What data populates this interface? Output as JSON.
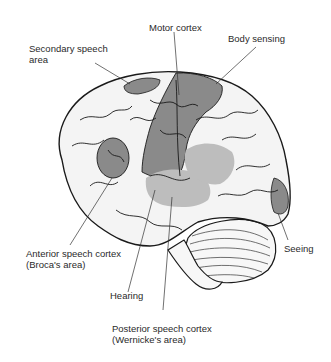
{
  "diagram": {
    "labels": {
      "secondary_speech": [
        "Secondary speech",
        "area"
      ],
      "motor_cortex": [
        "Motor cortex"
      ],
      "body_sensing": [
        "Body sensing"
      ],
      "broca": [
        "Anterior speech cortex",
        "(Broca's area)"
      ],
      "hearing": [
        "Hearing"
      ],
      "wernicke": [
        "Posterior speech cortex",
        "(Wernicke's area)"
      ],
      "seeing": [
        "Seeing"
      ]
    },
    "colors": {
      "outline": "#1a1a1a",
      "highlight_dark": "#8a8a8a",
      "highlight_light": "#bdbdbd",
      "brain_fill": "#f4f4f4",
      "background": "#ffffff"
    }
  }
}
